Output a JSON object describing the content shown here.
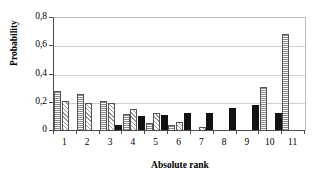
{
  "chart_data": {
    "type": "bar",
    "title": "",
    "xlabel": "Absolute rank",
    "ylabel": "Probability",
    "categories": [
      "1",
      "2",
      "3",
      "4",
      "5",
      "6",
      "7",
      "8",
      "9",
      "10",
      "11"
    ],
    "ylim": [
      0,
      0.8
    ],
    "ytick_labels": [
      "0,8",
      "0,6",
      "0,4",
      "0,2",
      "0"
    ],
    "ytick_values": [
      0.8,
      0.6,
      0.4,
      0.2,
      0
    ],
    "grid": true,
    "legend": "none",
    "decimal_separator": ",",
    "series": [
      {
        "name": "series-1",
        "fill": "vertical-line-hatch",
        "values": [
          0.28,
          0.26,
          0.21,
          0.12,
          0.06,
          0.045,
          0.0,
          0.0,
          0.0,
          0.31,
          0.69
        ]
      },
      {
        "name": "series-2",
        "fill": "diagonal-hatch",
        "values": [
          0.21,
          0.2,
          0.2,
          0.155,
          0.13,
          0.065,
          0.03,
          0.0,
          0.0,
          0.0,
          0.0
        ]
      },
      {
        "name": "series-3",
        "fill": "solid-black",
        "values": [
          0.0,
          0.0,
          0.045,
          0.105,
          0.11,
          0.125,
          0.13,
          0.165,
          0.185,
          0.125,
          0.0
        ]
      }
    ]
  },
  "colors": {
    "axis": "#4d4d4d",
    "grid": "#d0d0d0",
    "bar_outline": "#555555",
    "solid_series": "#111111",
    "background": "#ffffff"
  }
}
